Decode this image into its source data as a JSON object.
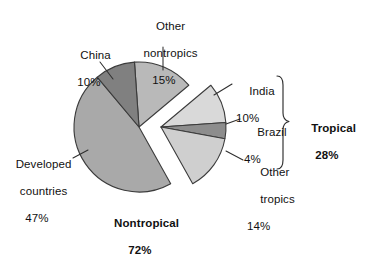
{
  "chart_data": {
    "type": "pie",
    "title": "",
    "subtitle": "",
    "xlabel": "",
    "ylabel": "",
    "legend_position": "callout-labels",
    "grid": false,
    "units": "percent",
    "total": 100,
    "categories": [
      "Other nontropics",
      "India",
      "Brazil",
      "Other tropics",
      "Developed countries",
      "China"
    ],
    "values": [
      15,
      10,
      4,
      14,
      47,
      10
    ],
    "slices": [
      {
        "label": "Other nontropics",
        "value": 15,
        "value_text": "15%",
        "group": "Nontropical",
        "color": "#b9b9b9",
        "exploded": false
      },
      {
        "label": "India",
        "value": 10,
        "value_text": "10%",
        "group": "Tropical",
        "color": "#d9d9d9",
        "exploded": true
      },
      {
        "label": "Brazil",
        "value": 4,
        "value_text": "4%",
        "group": "Tropical",
        "color": "#8d8d8d",
        "exploded": true
      },
      {
        "label": "Other tropics",
        "value": 14,
        "value_text": "14%",
        "group": "Tropical",
        "color": "#cfcfcf",
        "exploded": true
      },
      {
        "label": "Developed countries",
        "value": 47,
        "value_text": "47%",
        "group": "Nontropical",
        "color": "#a9a9a9",
        "exploded": false
      },
      {
        "label": "China",
        "value": 10,
        "value_text": "10%",
        "group": "Nontropical",
        "color": "#808080",
        "exploded": false
      }
    ],
    "groups": [
      {
        "label": "Nontropical",
        "value": 72,
        "value_text": "72%",
        "members": [
          "Developed countries",
          "China",
          "Other nontropics"
        ]
      },
      {
        "label": "Tropical",
        "value": 28,
        "value_text": "28%",
        "members": [
          "India",
          "Brazil",
          "Other tropics"
        ]
      }
    ]
  },
  "labels": {
    "other_nontropics": {
      "name": "Other",
      "name2": "nontropics",
      "pct": "15%"
    },
    "china": {
      "name": "China",
      "pct": "10%"
    },
    "developed": {
      "name": "Developed",
      "name2": "countries",
      "pct": "47%"
    },
    "india": {
      "name": "India",
      "pct": "10%"
    },
    "brazil": {
      "name": "Brazil",
      "pct": "4%"
    },
    "other_tropics": {
      "name": "Other",
      "name2": "tropics",
      "pct": "14%"
    },
    "nontropical": {
      "name": "Nontropical",
      "pct": "72%"
    },
    "tropical": {
      "name": "Tropical",
      "pct": "28%"
    }
  },
  "colors": {
    "background": "#ffffff",
    "outline": "#3b3b3b",
    "text": "#111111",
    "leader": "#2e2e2e",
    "developed_countries": "#a9a9a9",
    "china": "#808080",
    "other_nontropics": "#b9b9b9",
    "india": "#d9d9d9",
    "brazil": "#8d8d8d",
    "other_tropics": "#cfcfcf"
  }
}
